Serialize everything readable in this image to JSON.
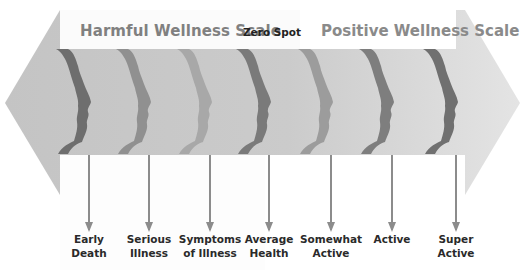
{
  "header": {
    "harmful_title": "Harmful Wellness Scale",
    "zero_title": "Zero Spot",
    "positive_title": "Positive Wellness Scale"
  },
  "colors": {
    "arrow_fill": "#c8c8c8",
    "arrow_fill_right": "#e0e0e0",
    "header_text": "#808080",
    "zero_text": "#222222",
    "label_text": "#2a2a2a",
    "pointer": "#8c8c8c"
  },
  "stages": [
    {
      "label_line1": "Early",
      "label_line2": "Death",
      "x": 88,
      "profile_color": "#6e6e6e",
      "icon": "head-profile-icon"
    },
    {
      "label_line1": "Serious",
      "label_line2": "Illness",
      "x": 148,
      "profile_color": "#909090",
      "icon": "head-profile-icon"
    },
    {
      "label_line1": "Symptoms",
      "label_line2": "of Illness",
      "x": 209,
      "profile_color": "#a8a8a8",
      "icon": "head-profile-icon"
    },
    {
      "label_line1": "Average",
      "label_line2": "Health",
      "x": 268,
      "profile_color": "#7a7a7a",
      "icon": "head-profile-icon"
    },
    {
      "label_line1": "Somewhat",
      "label_line2": "Active",
      "x": 330,
      "profile_color": "#9c9c9c",
      "icon": "head-profile-icon"
    },
    {
      "label_line1": "Active",
      "label_line2": "",
      "x": 391,
      "profile_color": "#7e7e7e",
      "icon": "head-profile-icon"
    },
    {
      "label_line1": "Super",
      "label_line2": "Active",
      "x": 455,
      "profile_color": "#707070",
      "icon": "head-profile-icon"
    }
  ]
}
